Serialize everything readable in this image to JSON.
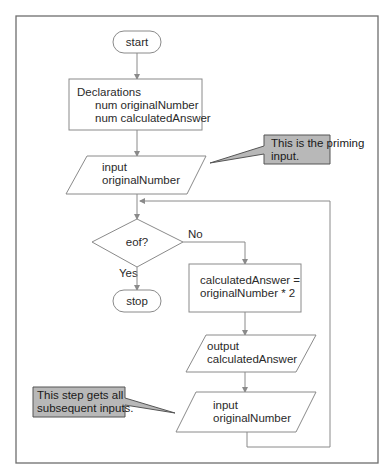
{
  "flowchart": {
    "start": {
      "label": "start"
    },
    "declarations": {
      "title": "Declarations",
      "lines": [
        "num originalNumber",
        "num calculatedAnswer"
      ]
    },
    "priming_input": {
      "lines": [
        "input",
        "originalNumber"
      ]
    },
    "decision": {
      "label": "eof?",
      "yes_label": "Yes",
      "no_label": "No"
    },
    "stop": {
      "label": "stop"
    },
    "process": {
      "lines": [
        "calculatedAnswer =",
        "originalNumber * 2"
      ]
    },
    "output": {
      "lines": [
        "output",
        "calculatedAnswer"
      ]
    },
    "loop_input": {
      "lines": [
        "input",
        "originalNumber"
      ]
    },
    "callouts": {
      "priming": {
        "lines": [
          "This is the priming",
          "input."
        ]
      },
      "subsequent": {
        "lines": [
          "This step gets all",
          "subsequent inputs."
        ]
      }
    }
  },
  "colors": {
    "callout_fill": "#b8b8b8",
    "line": "#8a8a8a"
  }
}
